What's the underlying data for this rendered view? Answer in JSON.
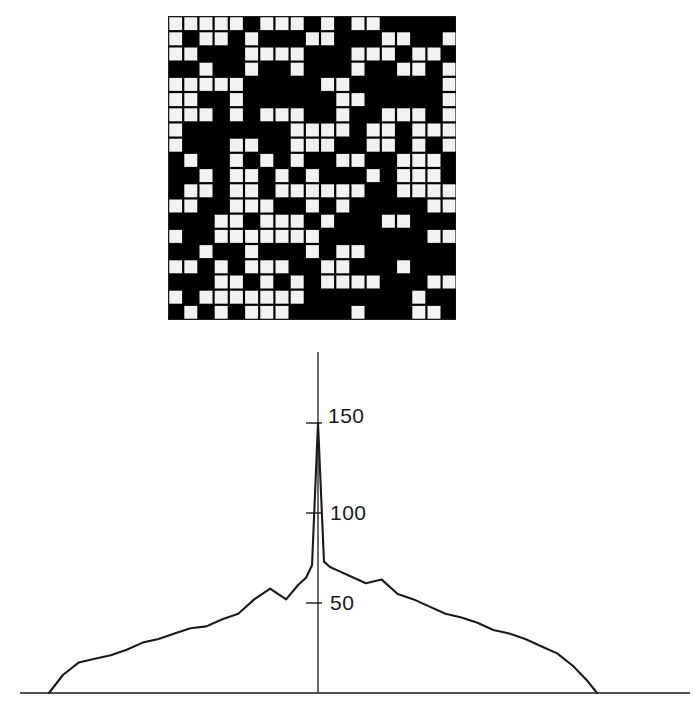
{
  "figure": {
    "panels": [
      {
        "name": "binary-grid",
        "kind": "bitmap-grid"
      },
      {
        "name": "autocorrelation-plot",
        "kind": "line-chart"
      }
    ],
    "colors": {
      "ink": "#111111",
      "cell_on": "#000000",
      "cell_off": "#f2f2f0",
      "grid_line": "#1a1a1a",
      "background": "#ffffff"
    }
  },
  "grid_panel": {
    "rows": 20,
    "cols": 19,
    "cell_size": 15.2,
    "legend": {
      "on": "black",
      "off": "white"
    },
    "matrix": [
      [
        0,
        0,
        0,
        0,
        0,
        1,
        0,
        0,
        0,
        1,
        0,
        1,
        0,
        0,
        1,
        1,
        1,
        1,
        1
      ],
      [
        0,
        1,
        0,
        0,
        1,
        0,
        1,
        1,
        1,
        0,
        0,
        1,
        1,
        1,
        0,
        0,
        1,
        1,
        0
      ],
      [
        0,
        0,
        1,
        1,
        1,
        0,
        0,
        0,
        0,
        1,
        1,
        1,
        0,
        0,
        0,
        1,
        0,
        0,
        1
      ],
      [
        1,
        1,
        0,
        1,
        1,
        0,
        1,
        1,
        0,
        1,
        1,
        1,
        0,
        1,
        1,
        0,
        0,
        1,
        0
      ],
      [
        0,
        0,
        0,
        0,
        0,
        1,
        1,
        1,
        1,
        1,
        0,
        0,
        1,
        1,
        1,
        1,
        1,
        1,
        0
      ],
      [
        0,
        0,
        1,
        1,
        0,
        1,
        1,
        1,
        1,
        1,
        1,
        0,
        0,
        1,
        1,
        1,
        1,
        1,
        0
      ],
      [
        0,
        0,
        0,
        1,
        0,
        1,
        0,
        0,
        0,
        1,
        1,
        0,
        1,
        1,
        0,
        0,
        0,
        1,
        0
      ],
      [
        0,
        1,
        1,
        1,
        1,
        1,
        1,
        1,
        0,
        0,
        0,
        0,
        1,
        0,
        0,
        1,
        0,
        0,
        0
      ],
      [
        0,
        1,
        1,
        1,
        0,
        0,
        1,
        1,
        0,
        0,
        0,
        1,
        1,
        0,
        0,
        1,
        0,
        1,
        0
      ],
      [
        1,
        0,
        1,
        1,
        0,
        1,
        0,
        1,
        0,
        1,
        1,
        0,
        0,
        1,
        1,
        0,
        0,
        0,
        1
      ],
      [
        1,
        1,
        0,
        1,
        0,
        0,
        1,
        0,
        1,
        0,
        1,
        1,
        1,
        0,
        1,
        0,
        0,
        0,
        1
      ],
      [
        1,
        0,
        0,
        1,
        0,
        0,
        1,
        0,
        0,
        0,
        0,
        0,
        0,
        1,
        1,
        0,
        0,
        0,
        0
      ],
      [
        0,
        0,
        1,
        1,
        0,
        0,
        0,
        1,
        1,
        0,
        1,
        0,
        1,
        1,
        1,
        1,
        1,
        0,
        0
      ],
      [
        1,
        1,
        1,
        0,
        0,
        1,
        0,
        0,
        0,
        1,
        0,
        1,
        1,
        1,
        0,
        0,
        1,
        1,
        1
      ],
      [
        0,
        1,
        1,
        0,
        0,
        0,
        0,
        0,
        0,
        0,
        1,
        1,
        1,
        1,
        1,
        1,
        1,
        0,
        0
      ],
      [
        1,
        1,
        0,
        1,
        1,
        0,
        1,
        1,
        1,
        0,
        1,
        0,
        0,
        1,
        1,
        1,
        1,
        1,
        1
      ],
      [
        0,
        0,
        1,
        0,
        1,
        0,
        0,
        0,
        1,
        1,
        0,
        0,
        1,
        1,
        1,
        0,
        1,
        1,
        1
      ],
      [
        1,
        1,
        1,
        0,
        0,
        1,
        0,
        1,
        0,
        1,
        0,
        0,
        0,
        0,
        1,
        1,
        1,
        0,
        0
      ],
      [
        0,
        1,
        0,
        0,
        0,
        0,
        0,
        0,
        0,
        1,
        1,
        1,
        1,
        1,
        1,
        1,
        0,
        1,
        1
      ],
      [
        1,
        0,
        1,
        0,
        1,
        0,
        0,
        0,
        1,
        1,
        1,
        1,
        0,
        1,
        1,
        1,
        0,
        0,
        1
      ]
    ]
  },
  "chart_data": {
    "type": "line",
    "title": "",
    "xlabel": "",
    "ylabel": "",
    "grid": false,
    "legend": null,
    "axis": {
      "y_axis_x_position": 318,
      "y_tick_values": [
        50,
        100,
        150
      ],
      "y_tick_labels": [
        "50",
        "100",
        "150"
      ],
      "baseline_value": 0,
      "ylim": [
        0,
        160
      ],
      "xlim": [
        -148,
        148
      ],
      "x_tick_labels": []
    },
    "x": [
      -135,
      -128,
      -120,
      -112,
      -104,
      -96,
      -88,
      -80,
      -72,
      -64,
      -56,
      -48,
      -40,
      -32,
      -24,
      -16,
      -10,
      -6,
      -3,
      0,
      3,
      6,
      10,
      16,
      24,
      32,
      40,
      48,
      56,
      64,
      72,
      80,
      88,
      96,
      104,
      112,
      120,
      128,
      135,
      140
    ],
    "values": [
      0,
      10,
      17,
      19,
      21,
      24,
      28,
      30,
      33,
      36,
      37,
      41,
      44,
      52,
      58,
      52,
      60,
      64,
      71,
      150,
      73,
      70,
      68,
      65,
      61,
      63,
      55,
      52,
      48,
      44,
      42,
      39,
      35,
      33,
      30,
      26,
      22,
      15,
      7,
      0
    ],
    "peak": {
      "x": 0,
      "y": 150
    }
  },
  "tick_labels": {
    "t50": "50",
    "t100": "100",
    "t150": "150"
  }
}
